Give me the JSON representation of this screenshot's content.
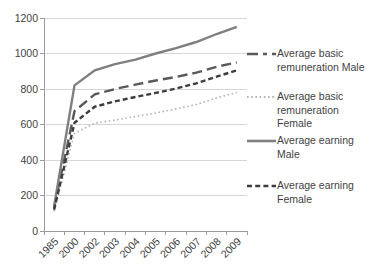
{
  "chart_data": {
    "type": "line",
    "title": "",
    "xlabel": "",
    "ylabel": "",
    "categories": [
      "1985",
      "2000",
      "2002",
      "2003",
      "2004",
      "2005",
      "2006",
      "2007",
      "2008",
      "2009"
    ],
    "yticks": [
      "0",
      "200",
      "400",
      "600",
      "800",
      "1000",
      "1200"
    ],
    "ylim": [
      0,
      1200
    ],
    "grid": true,
    "legend_position": "right",
    "axis_color": "#9b9b9b",
    "grid_color": "#d6d6d6",
    "text_color": "#3f3f3f",
    "background_color": "#ffffff",
    "series": [
      {
        "name": "Average basic remuneration Male",
        "dash": "long-dash",
        "color": "#595959",
        "width": 2.4,
        "values": [
          130,
          675,
          770,
          800,
          825,
          848,
          868,
          892,
          925,
          950
        ]
      },
      {
        "name": "Average basic remuneration Female",
        "dash": "dotted",
        "color": "#b5b5b5",
        "width": 1.6,
        "values": [
          110,
          550,
          608,
          625,
          645,
          665,
          688,
          712,
          750,
          780
        ]
      },
      {
        "name": "Average earning Male",
        "dash": "solid",
        "color": "#7f7f7f",
        "width": 2.4,
        "values": [
          140,
          820,
          905,
          940,
          965,
          1000,
          1030,
          1065,
          1110,
          1150
        ]
      },
      {
        "name": "Average earning Female",
        "dash": "short-dash",
        "color": "#3d3d3d",
        "width": 2.4,
        "values": [
          120,
          610,
          700,
          730,
          755,
          778,
          802,
          832,
          870,
          905
        ]
      }
    ]
  }
}
